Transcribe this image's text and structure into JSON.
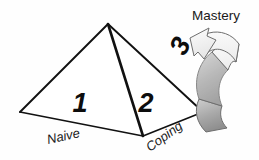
{
  "diagram": {
    "background_color": "#fefefe",
    "line_color": "#111111",
    "shape": {
      "name": "pyramid",
      "apex": [
        108,
        24
      ],
      "base_left": [
        20,
        112
      ],
      "base_right": [
        203,
        112
      ],
      "base_front": [
        143,
        136
      ]
    },
    "faces": [
      {
        "id": "face-1",
        "number": "1",
        "label": "Naive",
        "number_pos": [
          80,
          112
        ]
      },
      {
        "id": "face-2",
        "number": "2",
        "label": "Coping",
        "number_pos": [
          146,
          112
        ]
      }
    ],
    "stage_numbers": [
      {
        "name": "stage-number-1",
        "value": "1",
        "x": 80,
        "y": 112,
        "rotate": 0
      },
      {
        "name": "stage-number-2",
        "value": "2",
        "x": 145,
        "y": 112,
        "rotate": 0
      },
      {
        "name": "stage-number-3",
        "value": "3",
        "x": 178,
        "y": 52,
        "rotate": -62
      }
    ],
    "edge_labels": [
      {
        "name": "edge-label-naive",
        "text": "Naive",
        "x": 48,
        "y": 141,
        "rotate": -14
      },
      {
        "name": "edge-label-coping",
        "text": "Coping",
        "x": 150,
        "y": 153,
        "rotate": -37
      }
    ],
    "callout": {
      "name": "mastery-label",
      "text": "Mastery",
      "x": 192,
      "y": 20
    },
    "arrow": {
      "name": "curved-arrow",
      "description": "thick curved ribbon arrow sweeping from lower right up and around, head pointing up-left toward pyramid apex",
      "head_fill": "#f2f2f2",
      "mid_fill": "#e2e2e2",
      "tail_fill": "#9a9a9a",
      "outline": "#6e6e6e",
      "direction": "counter-clockwise-up"
    }
  }
}
